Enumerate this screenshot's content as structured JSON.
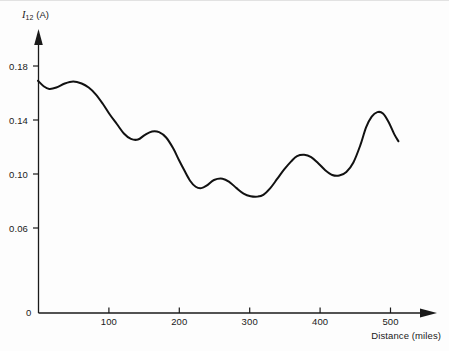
{
  "figure": {
    "background_color": "#fdfdfd",
    "ink_color": "#1a1a1a",
    "origin_label": "0"
  },
  "chart_data": {
    "type": "line",
    "title": "",
    "subtitle": "",
    "xlabel": "Distance (miles)",
    "ylabel": "I12 (A)",
    "ylabel_symbol": "I",
    "ylabel_subscript": "12",
    "ylabel_unit": "(A)",
    "grid": false,
    "legend": "none",
    "xlim": [
      0,
      565
    ],
    "ylim": [
      0,
      0.196
    ],
    "xticks": [
      0,
      100,
      200,
      300,
      400,
      500
    ],
    "xtick_labels": [
      "0",
      "100",
      "200",
      "300",
      "400",
      "500"
    ],
    "yticks": [
      0.06,
      0.1,
      0.14,
      0.18
    ],
    "ytick_labels": [
      "0.06",
      "0.10",
      "0.14",
      "0.18"
    ],
    "axis_style": "arrow-ended L-axes",
    "line_color": "#111111",
    "line_width": 2.0,
    "x": [
      0,
      8,
      16,
      26,
      38,
      50,
      62,
      72,
      82,
      92,
      102,
      112,
      122,
      132,
      142,
      152,
      162,
      172,
      182,
      192,
      200,
      208,
      216,
      224,
      232,
      240,
      250,
      262,
      272,
      282,
      292,
      302,
      312,
      320,
      330,
      340,
      350,
      360,
      368,
      378,
      388,
      398,
      408,
      418,
      428,
      438,
      448,
      458,
      466,
      474,
      482,
      490,
      498,
      506,
      512
    ],
    "y": [
      0.172,
      0.168,
      0.166,
      0.167,
      0.17,
      0.1715,
      0.17,
      0.167,
      0.162,
      0.155,
      0.147,
      0.14,
      0.133,
      0.129,
      0.1285,
      0.132,
      0.1345,
      0.134,
      0.13,
      0.122,
      0.1135,
      0.1055,
      0.098,
      0.0935,
      0.0925,
      0.0945,
      0.0985,
      0.0995,
      0.097,
      0.0925,
      0.0885,
      0.0865,
      0.0862,
      0.0875,
      0.0925,
      0.0995,
      0.1065,
      0.1125,
      0.1162,
      0.1172,
      0.1155,
      0.111,
      0.1058,
      0.1022,
      0.1018,
      0.1045,
      0.1115,
      0.1245,
      0.1375,
      0.1455,
      0.1488,
      0.1478,
      0.1415,
      0.1325,
      0.1272
    ],
    "annotations": []
  },
  "curve_extrema": {
    "start": {
      "x": 0,
      "y": 0.172
    },
    "local_minima": [
      {
        "x": 16,
        "y": 0.166
      },
      {
        "x": 133,
        "y": 0.1282
      },
      {
        "x": 230,
        "y": 0.0922
      },
      {
        "x": 314,
        "y": 0.0861
      },
      {
        "x": 430,
        "y": 0.1016
      },
      {
        "x": 602,
        "y": 0.1268
      }
    ],
    "local_maxima": [
      {
        "x": 50,
        "y": 0.1716
      },
      {
        "x": 166,
        "y": 0.1347
      },
      {
        "x": 264,
        "y": 0.0996
      },
      {
        "x": 378,
        "y": 0.1172
      },
      {
        "x": 544,
        "y": 0.1489
      }
    ],
    "end": {
      "x": 512,
      "y": 0.1845
    }
  },
  "geometry": {
    "y_axis_x_px": 38,
    "x_axis_y_px": 313,
    "x_px_per_100_miles": 70.4,
    "y_px_per_0_04_amp": 54
  }
}
